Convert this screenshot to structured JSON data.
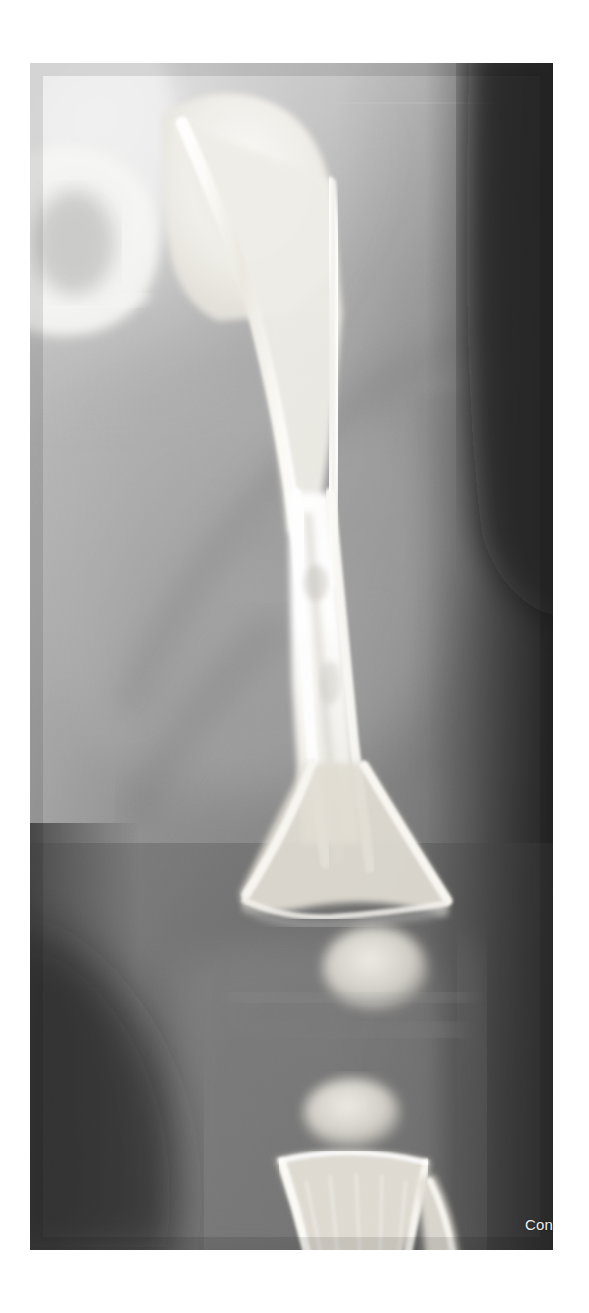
{
  "page": {
    "background_color": "#ffffff",
    "width": 589,
    "height": 1313
  },
  "figure": {
    "kind": "radiograph",
    "modality_label": "X-ray",
    "view": "AP",
    "region": "femur-knee",
    "frame": {
      "x": 30,
      "y": 63,
      "width": 523,
      "height": 1187
    },
    "base_tone": "#6e6e6e",
    "film_background": "#2a2a2a"
  },
  "watermark": {
    "text": "Con",
    "color": "#efefef",
    "position": "bottom-right",
    "truncated": true
  },
  "anatomy": {
    "labels": [
      "greater-trochanter",
      "femoral-neck",
      "femoral-head",
      "femoral-shaft",
      "distal-femoral-metaphysis",
      "distal-femoral-physis",
      "distal-femoral-epiphysis-ossification-center",
      "proximal-tibial-epiphysis-ossification-center",
      "proximal-tibial-metaphysis",
      "proximal-fibula",
      "soft-tissue-thigh"
    ]
  },
  "tones": {
    "cortical_bone": "#f4f2ee",
    "cancellous_bone": "#d9d6cf",
    "soft_tissue_light": "#9b9b9b",
    "soft_tissue_mid": "#7a7a7a",
    "soft_tissue_dark": "#4a4a4a",
    "film_edge_dark": "#1d1d1d",
    "collimation_shadow": "#3a3a3a"
  }
}
